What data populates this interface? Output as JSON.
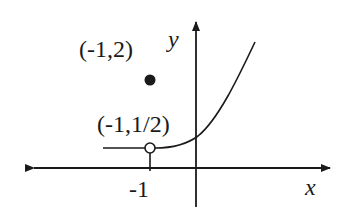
{
  "diagram": {
    "labels": {
      "filled_point": "(-1,2)",
      "open_point": "(-1,1/2)",
      "y_axis": "y",
      "x_axis": "x",
      "x_tick": "-1"
    },
    "colors": {
      "ink": "#1a1a1a",
      "background": "#ffffff"
    }
  }
}
